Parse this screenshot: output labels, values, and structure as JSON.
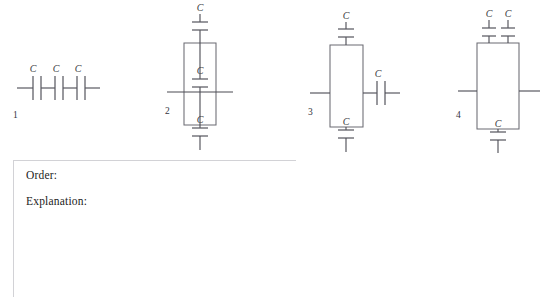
{
  "worksheet": {
    "circuits": [
      {
        "number": "1",
        "name": "three-capacitors-in-series",
        "capacitor_labels": [
          "C",
          "C",
          "C"
        ],
        "description": "Three capacitors in series along a horizontal wire"
      },
      {
        "number": "2",
        "name": "series-branch-with-parallel-middle",
        "capacitor_labels": [
          "C",
          "C",
          "C"
        ],
        "description": "Vertical loop: capacitor above, capacitor in the middle branch, capacitor below"
      },
      {
        "number": "3",
        "name": "parallel-pair-in-series-with-one",
        "capacitor_labels": [
          "C",
          "C",
          "C"
        ],
        "description": "Loop with top and bottom capacitors, plus one capacitor in series on the right lead"
      },
      {
        "number": "4",
        "name": "two-parallel-top-one-bottom",
        "capacitor_labels": [
          "C",
          "C",
          "C"
        ],
        "description": "Loop with two capacitors in parallel at the top and one capacitor at the bottom"
      }
    ],
    "answer_area": {
      "order_label": "Order:",
      "explanation_label": "Explanation:"
    },
    "colors": {
      "wire": "#4a4a52",
      "plate": "#5a5a62",
      "box": "#6b6b72",
      "rule": "#d2d2d6",
      "text": "#1c1c22",
      "background": "#ffffff"
    }
  }
}
